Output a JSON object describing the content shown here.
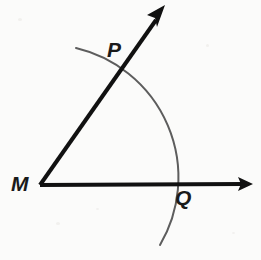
{
  "figure": {
    "type": "geometry-construction-diagram",
    "background_color": "#fbfbfa",
    "ray_color": "#111111",
    "arc_color": "#5d5d5d",
    "label_color": "#1a1a1a",
    "canvas": {
      "width": 261,
      "height": 260
    },
    "labels": [
      {
        "id": "M",
        "text": "M",
        "role": "vertex-label",
        "x": 11,
        "y": 173
      },
      {
        "id": "P",
        "text": "P",
        "role": "point-label",
        "x": 107,
        "y": 39
      },
      {
        "id": "Q",
        "text": "Q",
        "role": "point-label",
        "x": 175,
        "y": 187
      }
    ],
    "points": {
      "vertex_M": {
        "x": 40,
        "y": 185
      },
      "point_P": {
        "x": 113,
        "y": 72
      },
      "point_Q": {
        "x": 172,
        "y": 184
      }
    },
    "rays": [
      {
        "name": "horizontal-ray",
        "from": {
          "x": 40,
          "y": 185
        },
        "to": {
          "x": 250,
          "y": 184
        },
        "arrowhead": true,
        "stroke_width": 4
      },
      {
        "name": "diagonal-ray",
        "from": {
          "x": 40,
          "y": 185
        },
        "to": {
          "x": 163,
          "y": 10
        },
        "arrowhead": true,
        "stroke_width": 4
      }
    ],
    "arc": {
      "name": "construction-arc",
      "center": {
        "x": 40,
        "y": 185
      },
      "radius": 133,
      "start": {
        "x": 76,
        "y": 48
      },
      "end": {
        "x": 160,
        "y": 245
      },
      "stroke_width": 2,
      "color": "#5d5d5d"
    }
  }
}
